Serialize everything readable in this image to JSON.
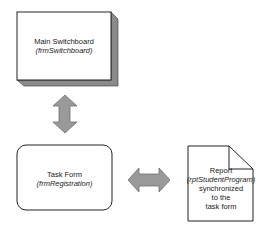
{
  "diagram": {
    "colors": {
      "stroke": "#222222",
      "shadow": "#8a8a8a",
      "arrow_fill": "#9a9a9a",
      "arrow_stroke": "#6f6f6f",
      "box_fill": "#ffffff"
    },
    "nodes": {
      "switchboard": {
        "title": "Main Switchboard",
        "object": "(frmSwitchboard)"
      },
      "task_form": {
        "title": "Task Form",
        "object": "(frmRegistration)"
      },
      "report": {
        "title": "Report",
        "object": "(rptStudentProgram)",
        "line3": "synchronized",
        "line4": "to the",
        "line5": "task form"
      }
    },
    "edges": [
      {
        "from": "switchboard",
        "to": "task_form",
        "type": "bidirectional",
        "orientation": "vertical"
      },
      {
        "from": "task_form",
        "to": "report",
        "type": "bidirectional",
        "orientation": "horizontal"
      }
    ]
  }
}
